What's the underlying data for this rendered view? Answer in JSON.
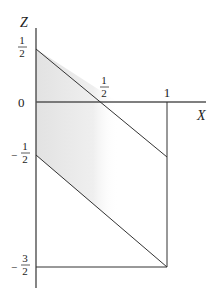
{
  "diagram": {
    "axes": {
      "vertical_label": "Z",
      "horizontal_label": "X"
    },
    "z_ticks": [
      {
        "label_num": "1",
        "label_den": "2",
        "sign": "",
        "value": 0.5
      },
      {
        "label": "0",
        "value": 0
      },
      {
        "label_num": "1",
        "label_den": "2",
        "sign": "−",
        "value": -0.5
      },
      {
        "label_num": "3",
        "label_den": "2",
        "sign": "−",
        "value": -1.5
      }
    ],
    "x_ticks": [
      {
        "label_num": "1",
        "label_den": "2",
        "value": 0.5
      },
      {
        "label": "1",
        "value": 1
      }
    ],
    "lines": [
      {
        "name": "upper-diagonal",
        "from": [
          0,
          0.5
        ],
        "to": [
          1,
          -0.5
        ]
      },
      {
        "name": "lower-diagonal",
        "from": [
          0,
          -0.5
        ],
        "to": [
          1,
          -1.5
        ]
      },
      {
        "name": "x-equals-1",
        "from": [
          1,
          0
        ],
        "to": [
          1,
          -1.5
        ]
      },
      {
        "name": "z-equals-minus-3-2",
        "from": [
          0,
          -1.5
        ],
        "to": [
          1,
          -1.5
        ]
      }
    ],
    "shading_color": "#e6e6e6",
    "line_color": "#333333"
  }
}
